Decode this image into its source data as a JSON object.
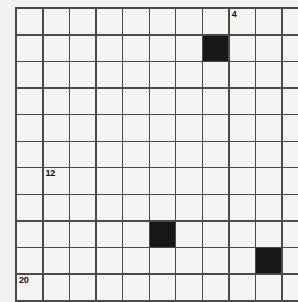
{
  "puzzle": {
    "title": "Crossword Grid",
    "type": "crossword-grid",
    "rows": 11,
    "columns": 11,
    "cell_size_px": 25.2,
    "grid_origin": {
      "x": 15,
      "y": 7
    },
    "colors": {
      "page_background": "#f2f2f0",
      "cell_background": "#f4f4f2",
      "block_color": "#171717",
      "grid_line": "#4a4a4a",
      "number_color": "#101010"
    },
    "block_cells": [
      {
        "row": 1,
        "col": 7
      },
      {
        "row": 8,
        "col": 5
      },
      {
        "row": 9,
        "col": 9
      }
    ],
    "numbered_cells": [
      {
        "row": 0,
        "col": 8,
        "number": "4"
      },
      {
        "row": 6,
        "col": 1,
        "number": "12"
      },
      {
        "row": 10,
        "col": 0,
        "number": "20"
      }
    ],
    "cells": [
      [
        {
          "block": false,
          "number": null,
          "letter": null
        },
        {
          "block": false,
          "number": null,
          "letter": null
        },
        {
          "block": false,
          "number": null,
          "letter": null
        },
        {
          "block": false,
          "number": null,
          "letter": null
        },
        {
          "block": false,
          "number": null,
          "letter": null
        },
        {
          "block": false,
          "number": null,
          "letter": null
        },
        {
          "block": false,
          "number": null,
          "letter": null
        },
        {
          "block": false,
          "number": null,
          "letter": null
        },
        {
          "block": false,
          "number": "4",
          "letter": null
        },
        {
          "block": false,
          "number": null,
          "letter": null
        },
        {
          "block": false,
          "number": null,
          "letter": null
        }
      ],
      [
        {
          "block": false,
          "number": null,
          "letter": null
        },
        {
          "block": false,
          "number": null,
          "letter": null
        },
        {
          "block": false,
          "number": null,
          "letter": null
        },
        {
          "block": false,
          "number": null,
          "letter": null
        },
        {
          "block": false,
          "number": null,
          "letter": null
        },
        {
          "block": false,
          "number": null,
          "letter": null
        },
        {
          "block": false,
          "number": null,
          "letter": null
        },
        {
          "block": true,
          "number": null,
          "letter": null
        },
        {
          "block": false,
          "number": null,
          "letter": null
        },
        {
          "block": false,
          "number": null,
          "letter": null
        },
        {
          "block": false,
          "number": null,
          "letter": null
        }
      ],
      [
        {
          "block": false,
          "number": null,
          "letter": null
        },
        {
          "block": false,
          "number": null,
          "letter": null
        },
        {
          "block": false,
          "number": null,
          "letter": null
        },
        {
          "block": false,
          "number": null,
          "letter": null
        },
        {
          "block": false,
          "number": null,
          "letter": null
        },
        {
          "block": false,
          "number": null,
          "letter": null
        },
        {
          "block": false,
          "number": null,
          "letter": null
        },
        {
          "block": false,
          "number": null,
          "letter": null
        },
        {
          "block": false,
          "number": null,
          "letter": null
        },
        {
          "block": false,
          "number": null,
          "letter": null
        },
        {
          "block": false,
          "number": null,
          "letter": null
        }
      ],
      [
        {
          "block": false,
          "number": null,
          "letter": null
        },
        {
          "block": false,
          "number": null,
          "letter": null
        },
        {
          "block": false,
          "number": null,
          "letter": null
        },
        {
          "block": false,
          "number": null,
          "letter": null
        },
        {
          "block": false,
          "number": null,
          "letter": null
        },
        {
          "block": false,
          "number": null,
          "letter": null
        },
        {
          "block": false,
          "number": null,
          "letter": null
        },
        {
          "block": false,
          "number": null,
          "letter": null
        },
        {
          "block": false,
          "number": null,
          "letter": null
        },
        {
          "block": false,
          "number": null,
          "letter": null
        },
        {
          "block": false,
          "number": null,
          "letter": null
        }
      ],
      [
        {
          "block": false,
          "number": null,
          "letter": null
        },
        {
          "block": false,
          "number": null,
          "letter": null
        },
        {
          "block": false,
          "number": null,
          "letter": null
        },
        {
          "block": false,
          "number": null,
          "letter": null
        },
        {
          "block": false,
          "number": null,
          "letter": null
        },
        {
          "block": false,
          "number": null,
          "letter": null
        },
        {
          "block": false,
          "number": null,
          "letter": null
        },
        {
          "block": false,
          "number": null,
          "letter": null
        },
        {
          "block": false,
          "number": null,
          "letter": null
        },
        {
          "block": false,
          "number": null,
          "letter": null
        },
        {
          "block": false,
          "number": null,
          "letter": null
        }
      ],
      [
        {
          "block": false,
          "number": null,
          "letter": null
        },
        {
          "block": false,
          "number": null,
          "letter": null
        },
        {
          "block": false,
          "number": null,
          "letter": null
        },
        {
          "block": false,
          "number": null,
          "letter": null
        },
        {
          "block": false,
          "number": null,
          "letter": null
        },
        {
          "block": false,
          "number": null,
          "letter": null
        },
        {
          "block": false,
          "number": null,
          "letter": null
        },
        {
          "block": false,
          "number": null,
          "letter": null
        },
        {
          "block": false,
          "number": null,
          "letter": null
        },
        {
          "block": false,
          "number": null,
          "letter": null
        },
        {
          "block": false,
          "number": null,
          "letter": null
        }
      ],
      [
        {
          "block": false,
          "number": null,
          "letter": null
        },
        {
          "block": false,
          "number": "12",
          "letter": null
        },
        {
          "block": false,
          "number": null,
          "letter": null
        },
        {
          "block": false,
          "number": null,
          "letter": null
        },
        {
          "block": false,
          "number": null,
          "letter": null
        },
        {
          "block": false,
          "number": null,
          "letter": null
        },
        {
          "block": false,
          "number": null,
          "letter": null
        },
        {
          "block": false,
          "number": null,
          "letter": null
        },
        {
          "block": false,
          "number": null,
          "letter": null
        },
        {
          "block": false,
          "number": null,
          "letter": null
        },
        {
          "block": false,
          "number": null,
          "letter": null
        }
      ],
      [
        {
          "block": false,
          "number": null,
          "letter": null
        },
        {
          "block": false,
          "number": null,
          "letter": null
        },
        {
          "block": false,
          "number": null,
          "letter": null
        },
        {
          "block": false,
          "number": null,
          "letter": null
        },
        {
          "block": false,
          "number": null,
          "letter": null
        },
        {
          "block": false,
          "number": null,
          "letter": null
        },
        {
          "block": false,
          "number": null,
          "letter": null
        },
        {
          "block": false,
          "number": null,
          "letter": null
        },
        {
          "block": false,
          "number": null,
          "letter": null
        },
        {
          "block": false,
          "number": null,
          "letter": null
        },
        {
          "block": false,
          "number": null,
          "letter": null
        }
      ],
      [
        {
          "block": false,
          "number": null,
          "letter": null
        },
        {
          "block": false,
          "number": null,
          "letter": null
        },
        {
          "block": false,
          "number": null,
          "letter": null
        },
        {
          "block": false,
          "number": null,
          "letter": null
        },
        {
          "block": false,
          "number": null,
          "letter": null
        },
        {
          "block": true,
          "number": null,
          "letter": null
        },
        {
          "block": false,
          "number": null,
          "letter": null
        },
        {
          "block": false,
          "number": null,
          "letter": null
        },
        {
          "block": false,
          "number": null,
          "letter": null
        },
        {
          "block": false,
          "number": null,
          "letter": null
        },
        {
          "block": false,
          "number": null,
          "letter": null
        }
      ],
      [
        {
          "block": false,
          "number": null,
          "letter": null
        },
        {
          "block": false,
          "number": null,
          "letter": null
        },
        {
          "block": false,
          "number": null,
          "letter": null
        },
        {
          "block": false,
          "number": null,
          "letter": null
        },
        {
          "block": false,
          "number": null,
          "letter": null
        },
        {
          "block": false,
          "number": null,
          "letter": null
        },
        {
          "block": false,
          "number": null,
          "letter": null
        },
        {
          "block": false,
          "number": null,
          "letter": null
        },
        {
          "block": false,
          "number": null,
          "letter": null
        },
        {
          "block": true,
          "number": null,
          "letter": null
        },
        {
          "block": false,
          "number": null,
          "letter": null
        }
      ],
      [
        {
          "block": false,
          "number": "20",
          "letter": null
        },
        {
          "block": false,
          "number": null,
          "letter": null
        },
        {
          "block": false,
          "number": null,
          "letter": null
        },
        {
          "block": false,
          "number": null,
          "letter": null
        },
        {
          "block": false,
          "number": null,
          "letter": null
        },
        {
          "block": false,
          "number": null,
          "letter": null
        },
        {
          "block": false,
          "number": null,
          "letter": null
        },
        {
          "block": false,
          "number": null,
          "letter": null
        },
        {
          "block": false,
          "number": null,
          "letter": null
        },
        {
          "block": false,
          "number": null,
          "letter": null
        },
        {
          "block": false,
          "number": null,
          "letter": null
        }
      ]
    ]
  }
}
